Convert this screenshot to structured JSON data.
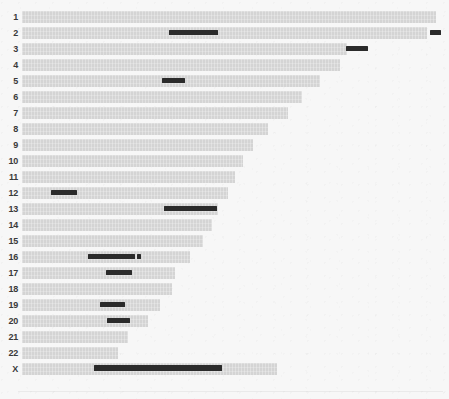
{
  "figure": {
    "type": "chromosome-ideogram",
    "background_color": "#f7f7f7",
    "chromosome_color": "#d4d4d4",
    "marker_color": "#2b2b2b",
    "axis_origin_x": 22,
    "row_height": 14,
    "row_pitch": 16.0,
    "first_row_y": 10
  },
  "chart_data": {
    "type": "bar",
    "title": "",
    "subtitle": "",
    "xlabel": "",
    "ylabel": "",
    "orientation": "horizontal",
    "grid": false,
    "legend": "none",
    "axis_origin_px": 22,
    "xlim": [
      0,
      449
    ],
    "categories": [
      "1",
      "2",
      "3",
      "4",
      "5",
      "6",
      "7",
      "8",
      "9",
      "10",
      "11",
      "12",
      "13",
      "14",
      "15",
      "16",
      "17",
      "18",
      "19",
      "20",
      "21",
      "22",
      "X"
    ],
    "series": [
      {
        "name": "chromosome length (px end)",
        "values": [
          436,
          427,
          347,
          340,
          320,
          302,
          288,
          268,
          253,
          243,
          235,
          228,
          218,
          212,
          203,
          190,
          175,
          172,
          160,
          148,
          128,
          118,
          277
        ]
      }
    ],
    "markers": [
      {
        "chromosome": "1",
        "segments": []
      },
      {
        "chromosome": "2",
        "segments": [
          {
            "start": 147,
            "end": 196
          },
          {
            "start": 408,
            "end": 419
          }
        ]
      },
      {
        "chromosome": "3",
        "segments": [
          {
            "start": 324,
            "end": 346
          }
        ]
      },
      {
        "chromosome": "4",
        "segments": []
      },
      {
        "chromosome": "5",
        "segments": [
          {
            "start": 140,
            "end": 163
          }
        ]
      },
      {
        "chromosome": "6",
        "segments": []
      },
      {
        "chromosome": "7",
        "segments": []
      },
      {
        "chromosome": "8",
        "segments": []
      },
      {
        "chromosome": "9",
        "segments": []
      },
      {
        "chromosome": "10",
        "segments": []
      },
      {
        "chromosome": "11",
        "segments": []
      },
      {
        "chromosome": "12",
        "segments": [
          {
            "start": 29,
            "end": 55
          }
        ]
      },
      {
        "chromosome": "13",
        "segments": [
          {
            "start": 142,
            "end": 195
          }
        ]
      },
      {
        "chromosome": "14",
        "segments": []
      },
      {
        "chromosome": "15",
        "segments": []
      },
      {
        "chromosome": "16",
        "segments": [
          {
            "start": 66,
            "end": 113
          },
          {
            "start": 115,
            "end": 119
          }
        ]
      },
      {
        "chromosome": "17",
        "segments": [
          {
            "start": 84,
            "end": 110
          }
        ]
      },
      {
        "chromosome": "18",
        "segments": []
      },
      {
        "chromosome": "19",
        "segments": [
          {
            "start": 78,
            "end": 103
          }
        ]
      },
      {
        "chromosome": "20",
        "segments": [
          {
            "start": 85,
            "end": 108
          }
        ]
      },
      {
        "chromosome": "21",
        "segments": []
      },
      {
        "chromosome": "22",
        "segments": []
      },
      {
        "chromosome": "X",
        "segments": [
          {
            "start": 72,
            "end": 200
          }
        ]
      }
    ]
  },
  "labels": {
    "c1": "1",
    "c2": "2",
    "c3": "3",
    "c4": "4",
    "c5": "5",
    "c6": "6",
    "c7": "7",
    "c8": "8",
    "c9": "9",
    "c10": "10",
    "c11": "11",
    "c12": "12",
    "c13": "13",
    "c14": "14",
    "c15": "15",
    "c16": "16",
    "c17": "17",
    "c18": "18",
    "c19": "19",
    "c20": "20",
    "c21": "21",
    "c22": "22",
    "cX": "X"
  }
}
